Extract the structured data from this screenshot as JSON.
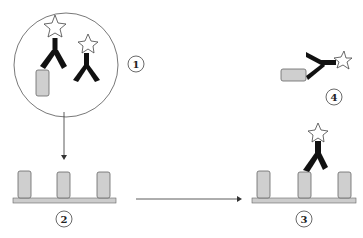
{
  "diagram": {
    "type": "immunoassay-schematic",
    "colors": {
      "antibody": "#111111",
      "antigen_fill": "#cfcfcf",
      "antigen_stroke": "#666666",
      "surface_fill": "#cccccc",
      "line": "#333333",
      "star_fill": "#ffffff"
    },
    "steps": [
      {
        "id": 1,
        "label": "1",
        "description": "Labeled antibodies in solution with antigen"
      },
      {
        "id": 2,
        "label": "2",
        "description": "Surface with immobilized antigens"
      },
      {
        "id": 3,
        "label": "3",
        "description": "Labeled antibody bound to surface antigen"
      },
      {
        "id": 4,
        "label": "4",
        "description": "Labeled antibody bound to free antigen"
      }
    ],
    "arrows": [
      {
        "from": "1",
        "to": "2",
        "direction": "down"
      },
      {
        "from": "2",
        "to": "3",
        "direction": "right"
      }
    ]
  }
}
